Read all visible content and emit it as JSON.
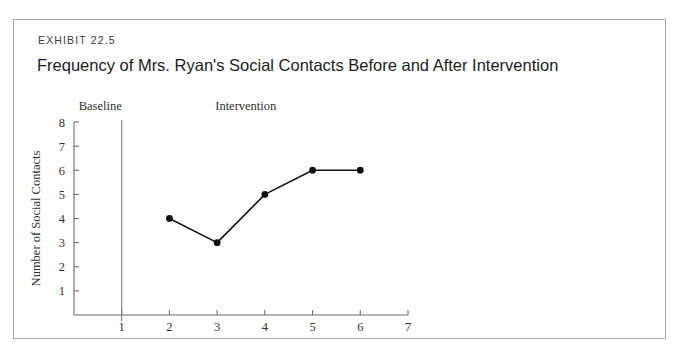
{
  "scan": {
    "top_sliver_text": "· · ·   · · · ·   · ·   · · ·   · · · · ·"
  },
  "exhibit": {
    "label": "EXHIBIT 22.5",
    "title": "Frequency of Mrs. Ryan's Social Contacts Before and After Intervention"
  },
  "colors": {
    "border": "#a9a9ad",
    "axis": "#6e6e73",
    "divider": "#7d7d82",
    "data": "#111113",
    "text": "#1d1d1f",
    "background": "#ffffff"
  },
  "chart_data": {
    "type": "line",
    "title": "Frequency of Mrs. Ryan's Social Contacts Before and After Intervention",
    "xlabel": "Weeks",
    "ylabel": "Number of Social Contacts",
    "xlim": [
      0,
      7
    ],
    "ylim": [
      0,
      8
    ],
    "x_ticks": [
      1,
      2,
      3,
      4,
      5,
      6,
      7
    ],
    "x_tick_labels": [
      "1",
      "2",
      "3",
      "4",
      "5",
      "6",
      "7"
    ],
    "y_ticks": [
      1,
      2,
      3,
      4,
      5,
      6,
      7,
      8
    ],
    "y_tick_labels": [
      "1",
      "2",
      "3",
      "4",
      "5",
      "6",
      "7",
      "8"
    ],
    "grid": false,
    "legend": false,
    "phases": [
      {
        "name": "Baseline",
        "label": "Baseline",
        "x_center": 0.55
      },
      {
        "name": "Intervention",
        "label": "Intervention",
        "x_center": 3.6
      }
    ],
    "phase_divider_x": 1,
    "series": [
      {
        "name": "Social contacts",
        "x": [
          2,
          3,
          4,
          5,
          6
        ],
        "values": [
          4,
          3,
          5,
          6,
          6
        ],
        "marker": "filled-circle",
        "color": "#111113"
      }
    ]
  }
}
